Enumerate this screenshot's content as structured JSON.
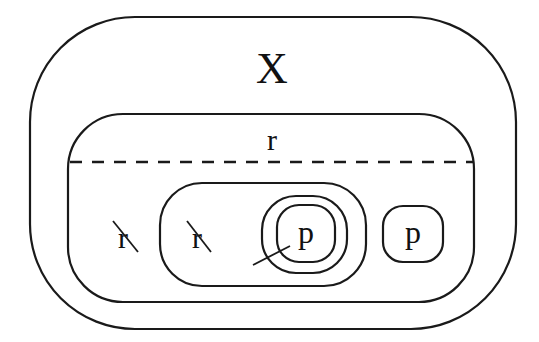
{
  "diagram": {
    "outer_label": "X",
    "region_label": "r",
    "lower_region": {
      "struck_label_left": "r",
      "inner_box": {
        "struck_label": "r",
        "nested_label": "p"
      },
      "right_box_label": "p"
    }
  },
  "colors": {
    "stroke": "#1a1a1a",
    "text": "#111111",
    "background": "#ffffff"
  }
}
